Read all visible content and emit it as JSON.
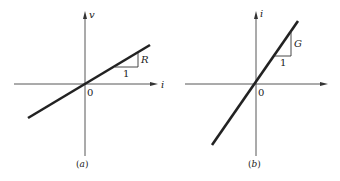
{
  "panels": [
    {
      "id": "a",
      "caption": "(a)",
      "caption_letter": "a",
      "vertical_axis_label": "v",
      "horizontal_axis_label": "i",
      "origin_label": "0",
      "slope_label": "R",
      "run_label": "1",
      "description": "Straight line through origin with slope R (v vs i)"
    },
    {
      "id": "b",
      "caption": "(b)",
      "caption_letter": "b",
      "vertical_axis_label": "i",
      "horizontal_axis_label": "",
      "origin_label": "0",
      "slope_label": "G",
      "run_label": "1",
      "description": "Straight line through origin with slope G (i vs v)"
    }
  ],
  "colors": {
    "line": "#222222",
    "axis": "#444444",
    "background": "#ffffff"
  }
}
